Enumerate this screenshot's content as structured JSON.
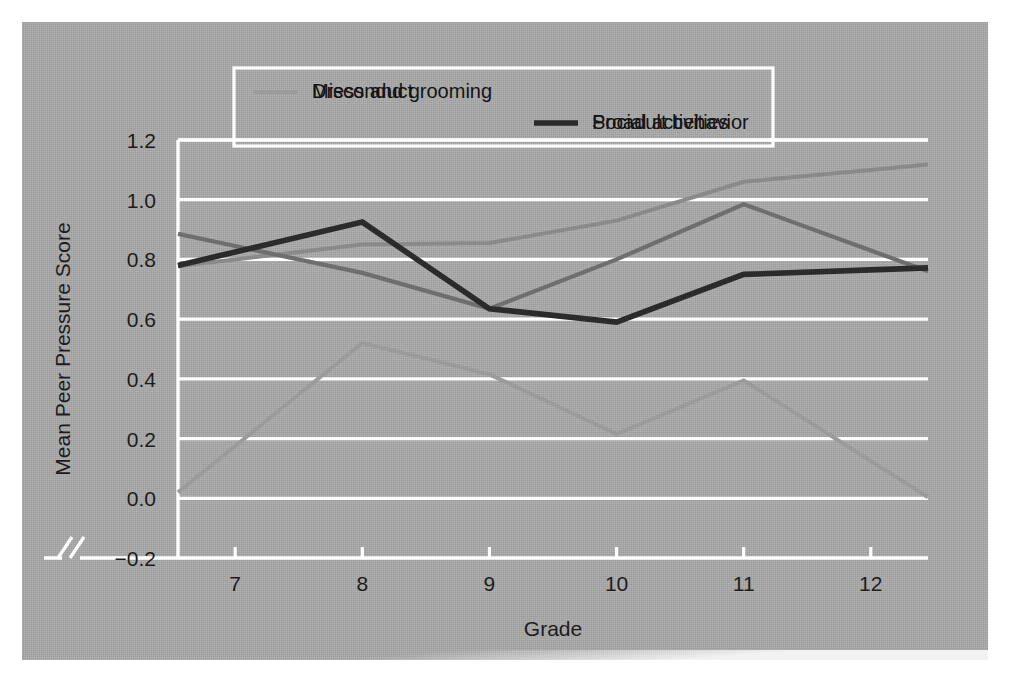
{
  "figure": {
    "background_color": "#a9a9a9",
    "gridline_color": "#ffffff",
    "frame_color": "#ffffff",
    "axis_break_symbol": "//"
  },
  "legend": {
    "position": "top-center",
    "entries": [
      {
        "label": "Dress and grooming",
        "color": "#8a8a8a"
      },
      {
        "label": "Social activities",
        "color": "#6e6e6e"
      },
      {
        "label": "Misconduct",
        "color": "#9b9b9b"
      },
      {
        "label": "Proadult behavior",
        "color": "#2b2b2b"
      }
    ]
  },
  "chart_data": {
    "type": "line",
    "title": "",
    "xlabel": "Grade",
    "ylabel": "Mean Peer Pressure  Score",
    "categories": [
      7,
      8,
      9,
      10,
      11,
      12
    ],
    "x_tick_labels": [
      "7",
      "8",
      "9",
      "10",
      "11",
      "12"
    ],
    "y_tick_labels": [
      "−0.2",
      "0.0",
      "0.2",
      "0.4",
      "0.6",
      "0.8",
      "1.0",
      "1.2"
    ],
    "y_ticks": [
      -0.2,
      0.0,
      0.2,
      0.4,
      0.6,
      0.8,
      1.0,
      1.2
    ],
    "ylim": [
      -0.2,
      1.2
    ],
    "xlim": [
      6.55,
      12.45
    ],
    "grid": true,
    "legend_position": "top-center",
    "series": [
      {
        "name": "Dress and grooming",
        "color": "#8a8a8a",
        "width": 4.0,
        "values": [
          0.8,
          0.85,
          0.855,
          0.93,
          1.06,
          1.1
        ]
      },
      {
        "name": "Social activities",
        "color": "#6e6e6e",
        "width": 4.2,
        "values": [
          0.845,
          0.755,
          0.635,
          0.8,
          0.985,
          0.83
        ]
      },
      {
        "name": "Misconduct",
        "color": "#9b9b9b",
        "width": 4.0,
        "values": [
          0.175,
          0.52,
          0.415,
          0.215,
          0.395,
          0.125
        ]
      },
      {
        "name": "Proadult behavior",
        "color": "#2b2b2b",
        "width": 5.6,
        "values": [
          0.825,
          0.925,
          0.635,
          0.59,
          0.75,
          0.765
        ]
      }
    ]
  }
}
